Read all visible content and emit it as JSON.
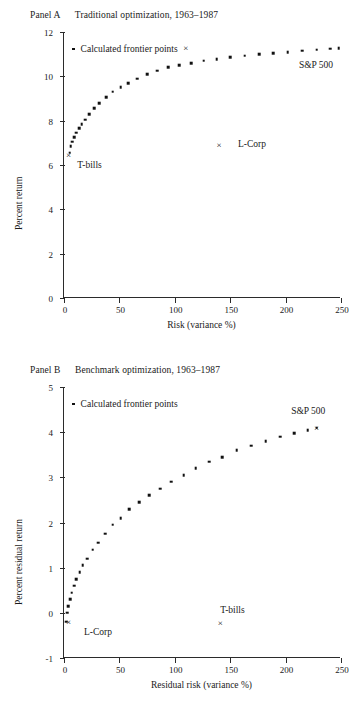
{
  "figure": {
    "panels": [
      {
        "id": "a",
        "caption_label": "Panel A",
        "caption_text": "Traditional optimization,  1963–1987",
        "legend_text": "Calculated frontier points",
        "annotations": [
          {
            "name": "sp500",
            "text": "S&P 500"
          },
          {
            "name": "lcorp",
            "text": "L-Corp"
          },
          {
            "name": "tbills",
            "text": "T-bills"
          }
        ]
      },
      {
        "id": "b",
        "caption_label": "Panel B",
        "caption_text": "Benchmark optimization,  1963–1987",
        "legend_text": "Calculated frontier points",
        "annotations": [
          {
            "name": "sp500",
            "text": "S&P 500"
          },
          {
            "name": "lcorp",
            "text": "L-Corp"
          },
          {
            "name": "tbills",
            "text": "T-bills"
          }
        ]
      }
    ]
  },
  "chart_data": [
    {
      "type": "scatter",
      "panel": "A",
      "title": "Panel A   Traditional optimization,  1963–1987",
      "xlabel": "Risk (variance %)",
      "ylabel": "Percent return",
      "xlim": [
        0,
        250
      ],
      "ylim": [
        0,
        12
      ],
      "xticks": [
        0,
        50,
        100,
        150,
        200,
        250
      ],
      "yticks": [
        0,
        2,
        4,
        6,
        8,
        10,
        12
      ],
      "grid": false,
      "legend": "Calculated frontier points",
      "legend_position": "top-left inside axes",
      "series": [
        {
          "name": "Calculated frontier points",
          "marker": "dot",
          "x": [
            5,
            6,
            7.5,
            9,
            11,
            13.5,
            16,
            19,
            23,
            27,
            32,
            38,
            44,
            51,
            58,
            66,
            75,
            84,
            94,
            104,
            115,
            126,
            138,
            150,
            163,
            176,
            189,
            202,
            215,
            228,
            240,
            248
          ],
          "y": [
            6.55,
            6.85,
            7.05,
            7.25,
            7.45,
            7.65,
            7.85,
            8.05,
            8.3,
            8.55,
            8.8,
            9.05,
            9.3,
            9.5,
            9.7,
            9.9,
            10.1,
            10.25,
            10.4,
            10.5,
            10.6,
            10.7,
            10.78,
            10.86,
            10.93,
            11.0,
            11.05,
            11.1,
            11.15,
            11.2,
            11.25,
            11.28
          ]
        },
        {
          "name": "S&P 500",
          "marker": "x",
          "x": [
            110
          ],
          "y": [
            11.3
          ]
        },
        {
          "name": "L-Corp",
          "marker": "x",
          "x": [
            140
          ],
          "y": [
            6.9
          ]
        },
        {
          "name": "T-bills",
          "marker": "x",
          "x": [
            4
          ],
          "y": [
            6.45
          ]
        }
      ],
      "annotations": [
        {
          "text": "S&P 500",
          "x": 212,
          "y": 10.45
        },
        {
          "text": "L-Corp",
          "x": 157,
          "y": 6.9
        },
        {
          "text": "T-bills",
          "x": 12,
          "y": 5.95
        }
      ]
    },
    {
      "type": "scatter",
      "panel": "B",
      "title": "Panel B   Benchmark optimization,  1963–1987",
      "xlabel": "Residual risk (variance %)",
      "ylabel": "Percent residual return",
      "xlim": [
        0,
        250
      ],
      "ylim": [
        -1,
        5
      ],
      "xticks": [
        0,
        50,
        100,
        150,
        200,
        250
      ],
      "yticks": [
        -1,
        0,
        1,
        2,
        3,
        4,
        5
      ],
      "grid": false,
      "legend": "Calculated frontier points",
      "legend_position": "top-left inside axes",
      "series": [
        {
          "name": "Calculated frontier points",
          "marker": "dot",
          "x": [
            2,
            3,
            4,
            5.5,
            7,
            9,
            11,
            14,
            17,
            21,
            26,
            31,
            37,
            44,
            51,
            59,
            68,
            77,
            87,
            97,
            108,
            119,
            131,
            143,
            156,
            169,
            182,
            195,
            208,
            220,
            228
          ],
          "y": [
            -0.2,
            0.0,
            0.15,
            0.3,
            0.45,
            0.6,
            0.75,
            0.9,
            1.05,
            1.2,
            1.4,
            1.55,
            1.75,
            1.95,
            2.1,
            2.3,
            2.45,
            2.6,
            2.75,
            2.9,
            3.05,
            3.2,
            3.35,
            3.45,
            3.6,
            3.7,
            3.8,
            3.9,
            3.98,
            4.05,
            4.1
          ]
        },
        {
          "name": "S&P 500",
          "marker": "x",
          "x": [
            228
          ],
          "y": [
            4.1
          ]
        },
        {
          "name": "L-Corp",
          "marker": "x",
          "x": [
            4
          ],
          "y": [
            -0.2
          ]
        },
        {
          "name": "T-bills",
          "marker": "x",
          "x": [
            141
          ],
          "y": [
            -0.22
          ]
        }
      ],
      "annotations": [
        {
          "text": "S&P 500",
          "x": 205,
          "y": 4.45
        },
        {
          "text": "L-Corp",
          "x": 18,
          "y": -0.45
        },
        {
          "text": "T-bills",
          "x": 141,
          "y": 0.05
        }
      ]
    }
  ]
}
